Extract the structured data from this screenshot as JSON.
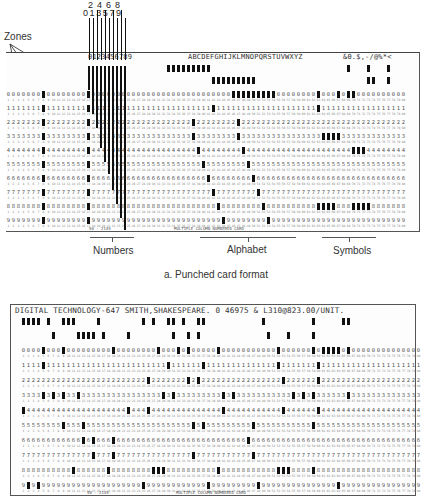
{
  "figure_a": {
    "caption": "a. Punched card format",
    "zones_label": "Zones",
    "zone_numbers": [
      "12",
      "11",
      "0"
    ],
    "column_digits_top": [
      "2",
      "4",
      "6",
      "8"
    ],
    "column_digits_bottom": [
      "0",
      "1",
      "3",
      "5",
      "7",
      "9"
    ],
    "card_header": {
      "numbers": "0123456789",
      "alphabet": "ABCDEFGHIJKLMNOPQRSTUVWXYZ",
      "symbols": "&0.$,-/@%*<"
    },
    "section_labels": [
      "Numbers",
      "Alphabet",
      "Symbols"
    ],
    "footer_left": "50 - 2149",
    "footer_center": "MULTIPLE COLUMN NUMBERED CARD"
  },
  "figure_b": {
    "card_header": "DIGITAL TECHNOLOGY-647 SMITH,SHAKESPEARE. 0 46975 & L310@823.00/UNIT.",
    "footer_left": "50 - 2149",
    "footer_center": "MULTIPLE COLUMN NUMBERED CARD"
  },
  "card": {
    "columns": 80,
    "row_digits": [
      "0",
      "1",
      "2",
      "3",
      "4",
      "5",
      "6",
      "7",
      "8",
      "9"
    ]
  }
}
